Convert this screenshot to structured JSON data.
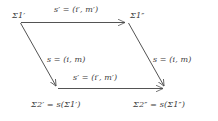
{
  "figure": {
    "type": "commutative-diagram",
    "shape": "parallelogram",
    "stroke_color": "#4a4a4a",
    "text_color": "#3b3b3b",
    "background_color": "#ffffff"
  },
  "nodes": {
    "top_left": "Σ1′",
    "top_right": "Σ1″",
    "bottom_left": "Σ2′ = s(Σ1′)",
    "bottom_right": "Σ2″ = s(Σ1″)"
  },
  "edges": {
    "top": "s′ = (i′, m′)",
    "left": "s = (i, m)",
    "right": "s = (i, m)",
    "bottom": "s′ = (i′, m′)"
  },
  "geometry": {
    "top_left_xy": "20,22",
    "top_right_xy": "128,22",
    "bottom_left_xy": "58,88",
    "bottom_right_xy": "166,88"
  }
}
